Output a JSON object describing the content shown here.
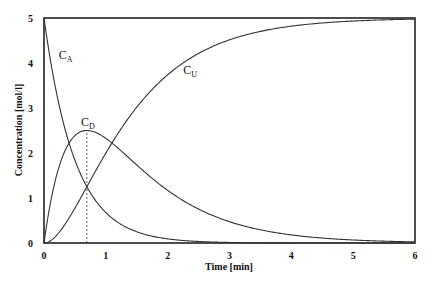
{
  "chart_data": {
    "type": "line",
    "title": "",
    "xlabel": "Time [min]",
    "ylabel": "Concentration [mol/l]",
    "xlim": [
      0,
      6
    ],
    "ylim": [
      0,
      5
    ],
    "xticks": [
      "0",
      "1",
      "2",
      "3",
      "4",
      "5",
      "6"
    ],
    "yticks": [
      "0",
      "1",
      "2",
      "3",
      "4",
      "5"
    ],
    "grid": false,
    "legend": "none",
    "model": {
      "C0": 5,
      "k1": 2,
      "k2": 1
    },
    "series": [
      {
        "name": "C_A",
        "label_main": "C",
        "label_sub": "A",
        "annot_at": [
          0.24,
          4.1
        ],
        "x": [
          0,
          0.25,
          0.5,
          0.75,
          1,
          1.5,
          2,
          3,
          4,
          5,
          6
        ],
        "y": [
          5,
          3.03,
          1.84,
          1.12,
          0.68,
          0.25,
          0.09,
          0.01,
          0,
          0,
          0
        ]
      },
      {
        "name": "C_D",
        "label_main": "C",
        "label_sub": "D",
        "annot_at": [
          0.6,
          2.6
        ],
        "x": [
          0,
          0.25,
          0.5,
          0.69,
          1,
          1.5,
          2,
          3,
          4,
          5,
          6
        ],
        "y": [
          0,
          1.83,
          2.39,
          2.5,
          2.33,
          1.73,
          1.17,
          0.47,
          0.18,
          0.07,
          0.02
        ]
      },
      {
        "name": "C_U",
        "label_main": "C",
        "label_sub": "U",
        "annot_at": [
          2.25,
          3.75
        ],
        "x": [
          0,
          0.25,
          0.5,
          0.69,
          1,
          1.5,
          2,
          3,
          4,
          5,
          6
        ],
        "y": [
          0,
          0.14,
          0.77,
          1.25,
          2.0,
          3.02,
          3.74,
          4.52,
          4.82,
          4.93,
          4.98
        ]
      }
    ],
    "annotations": [
      {
        "type": "vline",
        "x": 0.693,
        "y_from": 0,
        "y_to": 2.5,
        "style": "dashed"
      }
    ]
  }
}
